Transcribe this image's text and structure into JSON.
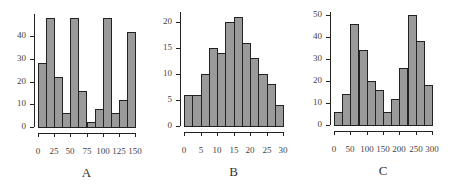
{
  "chart_data": [
    {
      "type": "bar",
      "panel": "A",
      "title": "A",
      "xlabel": "",
      "ylabel": "",
      "bin_edges": [
        0,
        12.5,
        25,
        37.5,
        50,
        62.5,
        75,
        87.5,
        100,
        112.5,
        125,
        137.5,
        150
      ],
      "values": [
        28,
        48,
        22,
        6,
        48,
        16,
        2,
        8,
        48,
        6,
        12,
        42
      ],
      "xticks": [
        "0",
        "25",
        "50",
        "75",
        "100",
        "125",
        "150"
      ],
      "yticks": [
        "0",
        "10",
        "20",
        "30",
        "40"
      ],
      "xlim": [
        0,
        150
      ],
      "ylim": [
        0,
        50
      ]
    },
    {
      "type": "bar",
      "panel": "B",
      "title": "B",
      "xlabel": "",
      "ylabel": "",
      "bin_edges": [
        0,
        2.5,
        5,
        7.5,
        10,
        12.5,
        15,
        17.5,
        20,
        22.5,
        25,
        27.5,
        30
      ],
      "values": [
        6,
        6,
        10,
        15,
        14,
        20,
        21,
        16,
        13,
        10,
        8,
        4
      ],
      "xticks": [
        "0",
        "5",
        "10",
        "15",
        "20",
        "25",
        "30"
      ],
      "yticks": [
        "0",
        "5",
        "10",
        "15",
        "20"
      ],
      "xlim": [
        0,
        30
      ],
      "ylim": [
        0,
        22
      ]
    },
    {
      "type": "bar",
      "panel": "C",
      "title": "C",
      "xlabel": "",
      "ylabel": "",
      "bin_edges": [
        0,
        25,
        50,
        75,
        100,
        125,
        150,
        175,
        200,
        225,
        250,
        275,
        300
      ],
      "values": [
        6,
        14,
        46,
        34,
        20,
        16,
        6,
        12,
        26,
        50,
        38,
        18
      ],
      "xticks": [
        "0",
        "50",
        "100",
        "150",
        "200",
        "250",
        "300"
      ],
      "yticks": [
        "0",
        "10",
        "20",
        "30",
        "40",
        "50"
      ],
      "xlim": [
        0,
        300
      ],
      "ylim": [
        0,
        50
      ]
    }
  ],
  "colors": {
    "bar_fill": "#9a9a9a",
    "bar_edge": "#222222",
    "axis": "#222222"
  }
}
